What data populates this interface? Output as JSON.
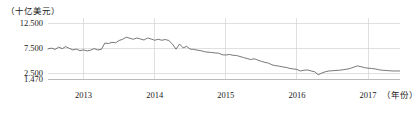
{
  "chart_data": {
    "type": "line",
    "title": "",
    "subtitle": "",
    "ylabel": "（十亿美元）",
    "xlabel": "（年份）",
    "y_unit_label": "（十亿美元）",
    "x_unit_label": "（年份）",
    "yticks": [
      "12.500",
      "7.500",
      "2.500",
      "1.470"
    ],
    "ytick_values": [
      12.5,
      7.5,
      2.5,
      1.47
    ],
    "ylim": [
      1.47,
      12.5
    ],
    "xticks": [
      "2013",
      "2014",
      "2015",
      "2016",
      "2017"
    ],
    "xtick_values": [
      2013,
      2014,
      2015,
      2016,
      2017
    ],
    "xlim": [
      2012.5,
      2017.45
    ],
    "grid": true,
    "legend": "none",
    "line_color": "#555555",
    "grid_color": "#cccccc",
    "series": [
      {
        "name": "值",
        "x": [
          2012.5,
          2012.55,
          2012.6,
          2012.65,
          2012.7,
          2012.75,
          2012.8,
          2012.85,
          2012.9,
          2012.95,
          2013.0,
          2013.05,
          2013.1,
          2013.15,
          2013.2,
          2013.25,
          2013.3,
          2013.35,
          2013.4,
          2013.45,
          2013.5,
          2013.55,
          2013.6,
          2013.65,
          2013.7,
          2013.75,
          2013.8,
          2013.85,
          2013.9,
          2013.95,
          2014.0,
          2014.05,
          2014.1,
          2014.15,
          2014.2,
          2014.25,
          2014.3,
          2014.35,
          2014.4,
          2014.45,
          2014.5,
          2014.55,
          2014.6,
          2014.65,
          2014.7,
          2014.75,
          2014.8,
          2014.85,
          2014.9,
          2014.95,
          2015.0,
          2015.05,
          2015.1,
          2015.15,
          2015.2,
          2015.25,
          2015.3,
          2015.35,
          2015.4,
          2015.45,
          2015.5,
          2015.55,
          2015.6,
          2015.65,
          2015.7,
          2015.75,
          2015.8,
          2015.85,
          2015.9,
          2015.95,
          2016.0,
          2016.05,
          2016.1,
          2016.15,
          2016.2,
          2016.25,
          2016.3,
          2016.35,
          2016.4,
          2016.45,
          2016.5,
          2016.55,
          2016.6,
          2016.65,
          2016.7,
          2016.75,
          2016.8,
          2016.85,
          2016.9,
          2016.95,
          2017.0,
          2017.05,
          2017.1,
          2017.15,
          2017.2,
          2017.25,
          2017.3,
          2017.35,
          2017.4,
          2017.45
        ],
        "values": [
          7.4,
          7.55,
          7.3,
          7.75,
          7.45,
          7.85,
          7.5,
          7.2,
          7.35,
          7.05,
          7.2,
          7.0,
          7.15,
          7.45,
          7.2,
          7.3,
          8.55,
          8.45,
          8.7,
          8.6,
          9.05,
          9.3,
          9.7,
          9.5,
          9.3,
          9.55,
          9.35,
          9.15,
          9.55,
          9.35,
          9.1,
          9.3,
          9.1,
          9.25,
          9.05,
          8.35,
          7.35,
          8.35,
          7.6,
          7.9,
          7.35,
          7.3,
          7.15,
          7.05,
          6.85,
          6.75,
          6.7,
          6.6,
          6.55,
          6.25,
          6.2,
          6.3,
          6.15,
          6.1,
          5.9,
          5.7,
          5.5,
          5.3,
          5.45,
          5.2,
          4.95,
          4.75,
          4.6,
          4.25,
          4.1,
          4.0,
          3.85,
          3.75,
          3.55,
          3.45,
          3.35,
          3.05,
          3.2,
          3.25,
          3.05,
          2.9,
          2.3,
          2.65,
          2.9,
          3.05,
          3.1,
          3.15,
          3.2,
          3.3,
          3.4,
          3.55,
          3.8,
          4.05,
          3.9,
          3.7,
          3.6,
          3.55,
          3.45,
          3.3,
          3.2,
          3.15,
          3.1,
          3.05,
          3.05,
          3.05
        ]
      }
    ]
  }
}
